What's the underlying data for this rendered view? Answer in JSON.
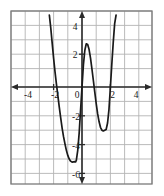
{
  "figure": {
    "title": "",
    "background_color": "#ffffff",
    "grid_color": "#b3b3b3",
    "border_color": "#7a7a7a",
    "axis_color": "#2b2b2b",
    "curve_color": "#1a1a1a"
  },
  "chart_data": {
    "type": "line",
    "title": "",
    "xlabel": "",
    "ylabel": "",
    "xlim": [
      -5,
      5
    ],
    "ylim": [
      -7,
      5
    ],
    "grid": true,
    "grid_step": 1,
    "legend": null,
    "x_ticks": [
      -4,
      -2,
      2,
      4
    ],
    "x_tick_labels": [
      "-4",
      "-2",
      "2",
      "4"
    ],
    "y_ticks": [
      4,
      2,
      -2,
      -4,
      -6
    ],
    "y_tick_labels": [
      "4",
      "2",
      "-2",
      "-4",
      "-6"
    ],
    "origin_label": "0",
    "series": [
      {
        "name": "quartic",
        "description": "W-shaped quartic polynomial with two local minima and one local maximum",
        "x": [
          -2.3,
          -2.2,
          -2.1,
          -2.0,
          -1.9,
          -1.8,
          -1.7,
          -1.6,
          -1.5,
          -1.4,
          -1.3,
          -1.2,
          -1.1,
          -1.0,
          -0.9,
          -0.8,
          -0.7,
          -0.6,
          -0.5,
          -0.45,
          -0.4,
          -0.3,
          -0.2,
          -0.1,
          0.0,
          0.1,
          0.2,
          0.3,
          0.4,
          0.5,
          0.6,
          0.7,
          0.8,
          0.9,
          1.0,
          1.1,
          1.2,
          1.3,
          1.4,
          1.5,
          1.6,
          1.7,
          1.8,
          1.9,
          2.0,
          2.1,
          2.2,
          2.3,
          2.4
        ],
        "y": [
          5.0,
          4.1,
          3.05,
          2.0,
          1.05,
          0.2,
          -0.6,
          -1.4,
          -2.15,
          -2.85,
          -3.45,
          -3.95,
          -4.4,
          -4.75,
          -5.0,
          -5.15,
          -5.22,
          -5.2,
          -5.18,
          -5.2,
          -5.1,
          -4.4,
          -3.2,
          -1.6,
          0.0,
          1.55,
          2.55,
          3.0,
          2.95,
          2.6,
          2.0,
          1.25,
          0.45,
          -0.35,
          -1.15,
          -1.85,
          -2.4,
          -2.8,
          -3.0,
          -3.05,
          -3.0,
          -2.95,
          -2.5,
          -1.55,
          0.0,
          1.6,
          3.1,
          4.4,
          5.0
        ]
      }
    ],
    "features": {
      "local_minima": [
        [
          -0.45,
          -5.2
        ],
        [
          1.7,
          -3.0
        ]
      ],
      "local_maximum": [
        0.3,
        3.0
      ],
      "x_intercepts": [
        -1.75,
        0.0,
        0.85,
        2.0
      ]
    }
  },
  "axes": {
    "x_axis_name": "x-axis",
    "y_axis_name": "y-axis",
    "arrow_ends": [
      "left",
      "right",
      "up",
      "down"
    ]
  }
}
